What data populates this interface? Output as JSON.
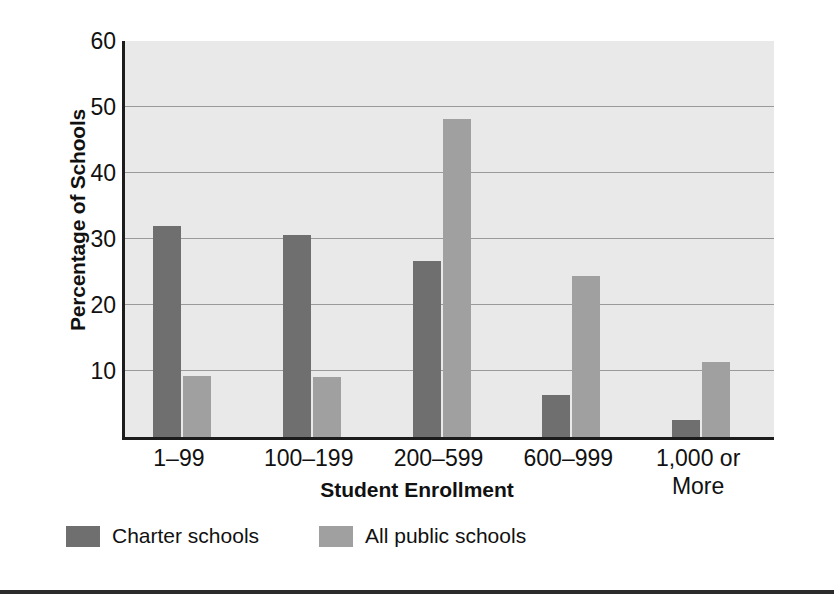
{
  "chart_data": {
    "type": "bar",
    "title": "",
    "xlabel": "Student Enrollment",
    "ylabel": "Percentage of Schools",
    "categories": [
      "1–99",
      "100–199",
      "200–599",
      "600–999",
      "1,000 or More"
    ],
    "category_lines": [
      [
        "1–99"
      ],
      [
        "100–199"
      ],
      [
        "200–599"
      ],
      [
        "600–999"
      ],
      [
        "1,000 or",
        "More"
      ]
    ],
    "series": [
      {
        "name": "Charter schools",
        "color": "#6f6f6f",
        "values": [
          32.0,
          30.6,
          26.7,
          6.4,
          2.6
        ]
      },
      {
        "name": "All public schools",
        "color": "#a0a0a0",
        "values": [
          9.2,
          9.1,
          48.2,
          24.4,
          11.4
        ]
      }
    ],
    "ylim": [
      0,
      60
    ],
    "yticks": [
      10,
      20,
      30,
      40,
      50,
      60
    ],
    "ytick_labels": [
      "10",
      "20",
      "30",
      "40",
      "50",
      "60"
    ],
    "grid": true,
    "gridlines_at": [
      10,
      20,
      30,
      40,
      50
    ],
    "legend_position": "bottom-left",
    "plot_background": "#e9e9e9"
  },
  "legend": {
    "items": [
      {
        "label": "Charter schools"
      },
      {
        "label": "All public schools"
      }
    ]
  }
}
